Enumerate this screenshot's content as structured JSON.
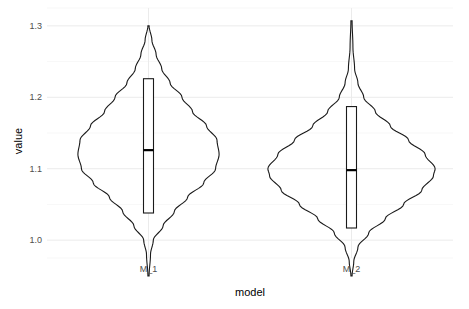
{
  "chart_data": {
    "type": "violin",
    "title": "",
    "xlabel": "model",
    "ylabel": "value",
    "ylim": [
      0.975,
      1.325
    ],
    "y_ticks": [
      "1.0",
      "1.1",
      "1.2",
      "1.3"
    ],
    "y_tick_values": [
      1.0,
      1.1,
      1.2,
      1.3
    ],
    "y_minor_tick_values": [
      0.95,
      1.05,
      1.15,
      1.25
    ],
    "grid": true,
    "legend": "none",
    "categories": [
      "M_1",
      "M_2"
    ],
    "series": [
      {
        "name": "M_1",
        "min": 0.95,
        "q1": 1.038,
        "median": 1.126,
        "q3": 1.226,
        "max": 1.3,
        "density_mode": 1.127,
        "density_profile": [
          [
            0.95,
            0.0
          ],
          [
            0.98,
            0.02
          ],
          [
            1.0,
            0.06
          ],
          [
            1.02,
            0.2
          ],
          [
            1.04,
            0.36
          ],
          [
            1.06,
            0.55
          ],
          [
            1.08,
            0.78
          ],
          [
            1.1,
            0.95
          ],
          [
            1.12,
            1.0
          ],
          [
            1.14,
            0.97
          ],
          [
            1.16,
            0.82
          ],
          [
            1.18,
            0.62
          ],
          [
            1.2,
            0.47
          ],
          [
            1.22,
            0.3
          ],
          [
            1.24,
            0.18
          ],
          [
            1.26,
            0.1
          ],
          [
            1.28,
            0.04
          ],
          [
            1.3,
            0.0
          ]
        ]
      },
      {
        "name": "M_2",
        "min": 0.95,
        "q1": 1.017,
        "median": 1.098,
        "q3": 1.187,
        "max": 1.307,
        "density_mode": 1.096,
        "density_profile": [
          [
            0.95,
            0.0
          ],
          [
            0.97,
            0.02
          ],
          [
            0.99,
            0.07
          ],
          [
            1.01,
            0.2
          ],
          [
            1.03,
            0.4
          ],
          [
            1.05,
            0.62
          ],
          [
            1.07,
            0.84
          ],
          [
            1.09,
            0.98
          ],
          [
            1.1,
            1.0
          ],
          [
            1.12,
            0.88
          ],
          [
            1.14,
            0.68
          ],
          [
            1.16,
            0.46
          ],
          [
            1.18,
            0.28
          ],
          [
            1.2,
            0.14
          ],
          [
            1.22,
            0.07
          ],
          [
            1.24,
            0.03
          ],
          [
            1.27,
            0.01
          ],
          [
            1.307,
            0.0
          ]
        ]
      }
    ]
  }
}
